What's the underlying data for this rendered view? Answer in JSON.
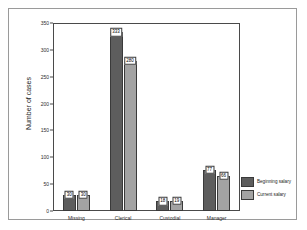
{
  "chart_data": {
    "type": "bar",
    "title": "",
    "xlabel": "",
    "ylabel": "Number of cases",
    "categories": [
      "Missing",
      "Clerical",
      "Custodial",
      "Manager"
    ],
    "series": [
      {
        "name": "Beginning salary",
        "color": "#5d5d5d",
        "values": [
          30,
          333,
          18,
          77
        ]
      },
      {
        "name": "Current salary",
        "color": "#a3a3a3",
        "values": [
          30,
          280,
          19,
          66
        ]
      }
    ],
    "ylim": [
      0,
      350
    ],
    "yticks": [
      0,
      50,
      100,
      150,
      200,
      250,
      300,
      350
    ],
    "grid": false,
    "legend_position": "right-bottom"
  },
  "legend": {
    "entries": [
      {
        "label": "Beginning salary"
      },
      {
        "label": "Current salary"
      }
    ]
  }
}
